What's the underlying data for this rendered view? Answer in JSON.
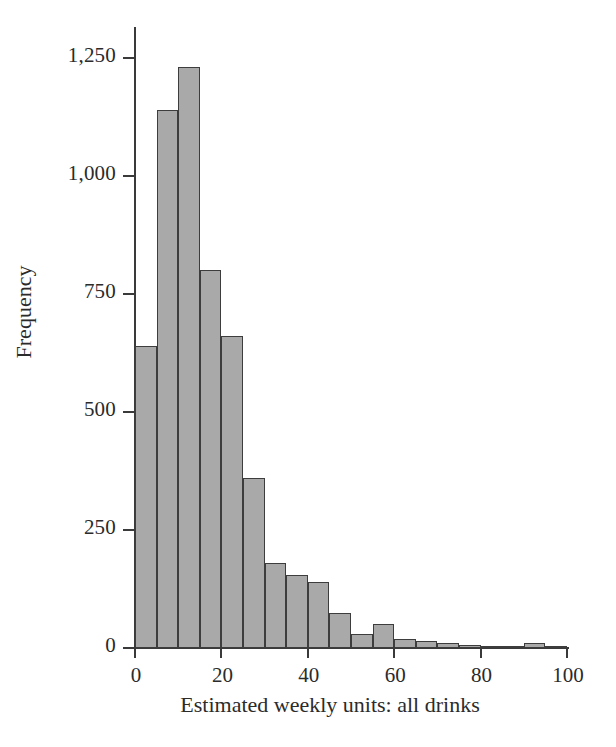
{
  "figure": {
    "background_color": "#ffffff",
    "bar_fill_color": "#a9a9a9",
    "bar_edge_color": "#3d3d3d",
    "axis_color": "#3a3a3a"
  },
  "chart_data": {
    "type": "bar",
    "chart_subtype": "histogram",
    "title": "",
    "xlabel": "Estimated weekly units: all drinks",
    "ylabel": "Frequency",
    "xlim": [
      0,
      100
    ],
    "ylim": [
      0,
      1250
    ],
    "bin_width": 5,
    "grid": false,
    "legend": null,
    "x_tick_labels": [
      "0",
      "20",
      "40",
      "60",
      "80",
      "100"
    ],
    "x_tick_values": [
      0,
      20,
      40,
      60,
      80,
      100
    ],
    "y_tick_labels": [
      "0",
      "250",
      "500",
      "750",
      "1,000",
      "1,250"
    ],
    "y_tick_values": [
      0,
      250,
      500,
      750,
      1000,
      1250
    ],
    "bin_starts": [
      0,
      5,
      10,
      15,
      20,
      25,
      30,
      35,
      40,
      45,
      50,
      55,
      60,
      65,
      70,
      75,
      80,
      85,
      90,
      95
    ],
    "bin_ends": [
      5,
      10,
      15,
      20,
      25,
      30,
      35,
      40,
      45,
      50,
      55,
      60,
      65,
      70,
      75,
      80,
      85,
      90,
      95,
      100
    ],
    "categories": [
      "0-5",
      "5-10",
      "10-15",
      "15-20",
      "20-25",
      "25-30",
      "30-35",
      "35-40",
      "40-45",
      "45-50",
      "50-55",
      "55-60",
      "60-65",
      "65-70",
      "70-75",
      "75-80",
      "80-85",
      "85-90",
      "90-95",
      "95-100"
    ],
    "values": [
      640,
      1140,
      1230,
      800,
      660,
      360,
      180,
      155,
      140,
      75,
      30,
      50,
      20,
      15,
      10,
      6,
      5,
      2,
      10,
      3
    ]
  }
}
